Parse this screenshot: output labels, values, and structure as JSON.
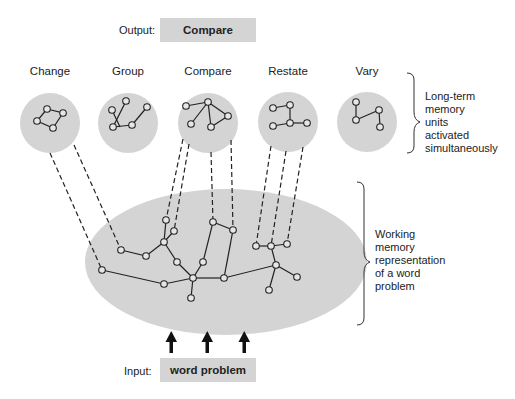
{
  "output": {
    "label": "Output:",
    "value": "Compare"
  },
  "input": {
    "label": "Input:",
    "value": "word problem"
  },
  "memory_units": [
    {
      "name": "Change"
    },
    {
      "name": "Group"
    },
    {
      "name": "Compare"
    },
    {
      "name": "Restate"
    },
    {
      "name": "Vary"
    }
  ],
  "annotations": {
    "long_term": [
      "Long-term",
      "memory",
      "units",
      "activated",
      "simultaneously"
    ],
    "working": [
      "Working",
      "memory",
      "representation",
      "of a word",
      "problem"
    ]
  },
  "colors": {
    "fill": "#d4d4d4",
    "stroke": "#222222",
    "node_fill": "#e6e6e6"
  },
  "arrows": {
    "count": 3
  }
}
